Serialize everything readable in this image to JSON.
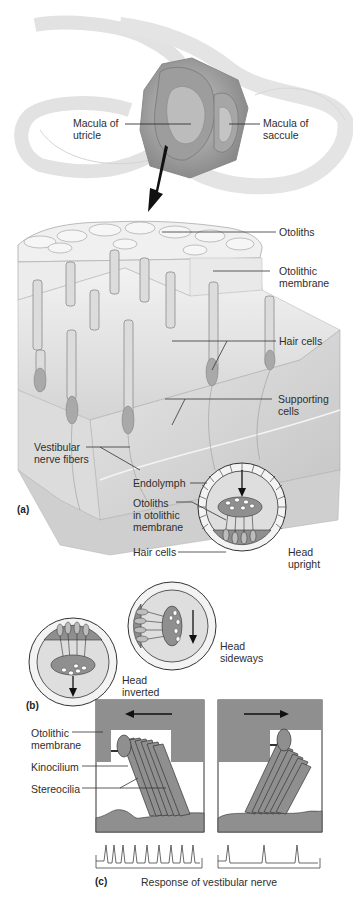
{
  "figure": {
    "panels": [
      "(a)",
      "(b)",
      "(c)"
    ],
    "colors": {
      "tissue_dark": "#8f8f8f",
      "tissue_mid": "#b4b4b4",
      "tissue_light": "#d9d9d9",
      "fluid": "#dedede",
      "line": "#333333",
      "background": "#ffffff"
    }
  },
  "overview": {
    "labels": {
      "macula_utricle": "Macula of\nutricle",
      "macula_saccule": "Macula of\nsaccule"
    }
  },
  "panel_a": {
    "letter": "(a)",
    "labels": {
      "otoliths": "Otoliths",
      "otolithic_membrane": "Otolithic\nmembrane",
      "hair_cells": "Hair cells",
      "supporting_cells": "Supporting\ncells",
      "vestibular_nerve_fibers": "Vestibular\nnerve fibers"
    },
    "inset": {
      "labels": {
        "endolymph": "Endolymph",
        "otoliths_in_membrane": "Otoliths\nin otolithic\nmembrane",
        "hair_cells": "Hair cells",
        "state": "Head\nupright"
      }
    }
  },
  "panel_b": {
    "letter": "(b)",
    "states": [
      {
        "label": "Head\nsideways"
      },
      {
        "label": "Head\ninverted"
      }
    ]
  },
  "panel_c": {
    "letter": "(c)",
    "labels": {
      "otolithic_membrane": "Otolithic\nmembrane",
      "kinocilium": "Kinocilium",
      "stereocilia": "Stereocilia"
    },
    "caption": "Response of vestibular nerve",
    "diagrams": [
      {
        "direction": "left",
        "spike_count": 8
      },
      {
        "direction": "right",
        "spike_count": 3
      }
    ]
  }
}
